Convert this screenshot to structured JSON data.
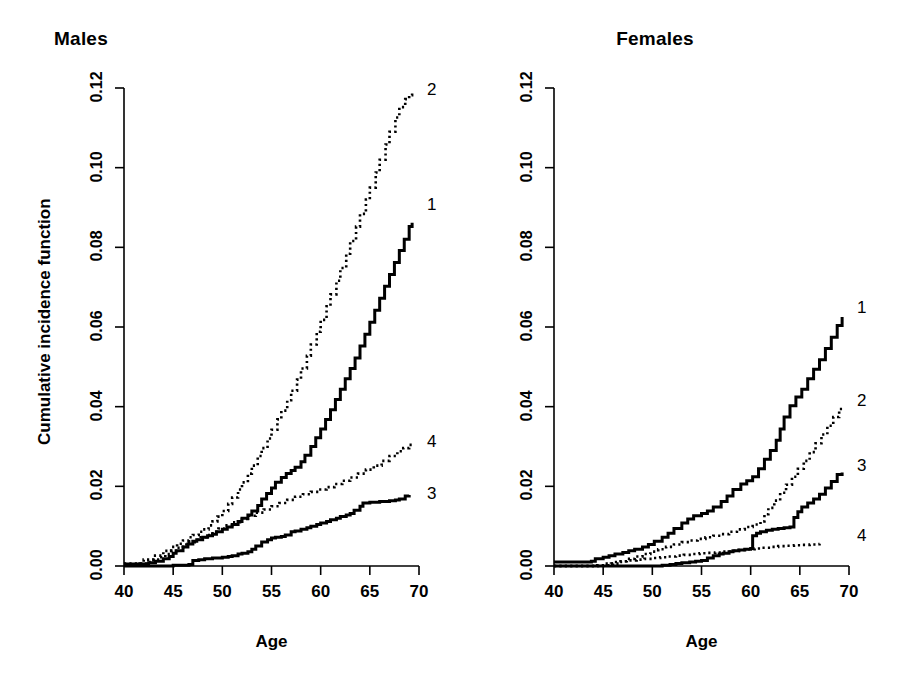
{
  "figure": {
    "background": "#ffffff",
    "ink": "#000000",
    "width": 912,
    "height": 693
  },
  "chart_data": {
    "type": "line",
    "title": "",
    "xlabel": "Age",
    "ylabel": "Cumulative incidence function",
    "xlim": [
      40,
      70
    ],
    "ylim": [
      0.0,
      0.12
    ],
    "xticks": [
      40,
      45,
      50,
      55,
      60,
      65,
      70
    ],
    "xtick_labels": [
      "40",
      "45",
      "50",
      "55",
      "60",
      "65",
      "70"
    ],
    "yticks": [
      0.0,
      0.02,
      0.04,
      0.06,
      0.08,
      0.1,
      0.12
    ],
    "ytick_labels": [
      "0.00",
      "0.02",
      "0.04",
      "0.06",
      "0.08",
      "0.10",
      "0.12"
    ],
    "grid": false,
    "legend_position": "right-of-curve-ends",
    "panels": [
      {
        "id": "males",
        "title": "Males",
        "series": [
          {
            "name": "1",
            "label": "1",
            "style": "solid",
            "stroke_width": 3,
            "label_x": 70.6,
            "label_y": 0.0905,
            "x": [
              40,
              42.5,
              43.2,
              44.0,
              44.6,
              45.0,
              45.3,
              46.0,
              46.5,
              47.0,
              47.4,
              48.0,
              48.5,
              49.0,
              49.4,
              50.0,
              50.5,
              51.0,
              51.6,
              52.0,
              52.6,
              53.0,
              53.6,
              54.0,
              54.5,
              55.0,
              55.4,
              56.0,
              56.5,
              57.0,
              57.4,
              58.0,
              58.4,
              59.0,
              59.5,
              60.0,
              60.5,
              61.0,
              61.5,
              62.0,
              62.5,
              63.0,
              63.5,
              64.0,
              64.5,
              65.0,
              65.5,
              66.0,
              66.5,
              67.0,
              67.5,
              68.0,
              68.5,
              69.0,
              69.3
            ],
            "y": [
              0.0005,
              0.0008,
              0.0012,
              0.0018,
              0.0024,
              0.0032,
              0.0038,
              0.0048,
              0.0055,
              0.0062,
              0.0066,
              0.0072,
              0.0076,
              0.008,
              0.0086,
              0.0092,
              0.0098,
              0.0104,
              0.0112,
              0.012,
              0.0128,
              0.0138,
              0.0152,
              0.0168,
              0.0182,
              0.0196,
              0.021,
              0.0222,
              0.0232,
              0.024,
              0.0248,
              0.0262,
              0.0278,
              0.03,
              0.0322,
              0.0344,
              0.0368,
              0.0392,
              0.0418,
              0.0444,
              0.047,
              0.0496,
              0.0522,
              0.0552,
              0.0582,
              0.0612,
              0.0642,
              0.0672,
              0.0702,
              0.0732,
              0.0762,
              0.0792,
              0.082,
              0.0852,
              0.0862
            ]
          },
          {
            "name": "2",
            "label": "2",
            "style": "dotted",
            "stroke_width": 2.6,
            "label_x": 70.6,
            "label_y": 0.1192,
            "x": [
              40,
              42.0,
              43.0,
              44.0,
              44.8,
              45.4,
              46.0,
              46.6,
              47.0,
              47.6,
              48.0,
              48.6,
              49.0,
              49.5,
              50.0,
              50.6,
              51.0,
              51.6,
              52.0,
              52.6,
              53.0,
              53.6,
              54.0,
              54.6,
              55.0,
              55.6,
              56.0,
              56.6,
              57.0,
              57.6,
              58.0,
              58.6,
              59.0,
              59.6,
              60.0,
              60.6,
              61.0,
              61.6,
              62.0,
              62.6,
              63.0,
              63.6,
              64.0,
              64.6,
              65.0,
              65.6,
              66.0,
              66.6,
              67.0,
              67.6,
              68.0,
              68.6,
              69.0,
              69.3
            ],
            "y": [
              0.0006,
              0.0016,
              0.0026,
              0.0038,
              0.0048,
              0.0056,
              0.0064,
              0.0072,
              0.0078,
              0.0086,
              0.0092,
              0.0102,
              0.0112,
              0.0124,
              0.0138,
              0.0156,
              0.0172,
              0.0192,
              0.021,
              0.0232,
              0.0252,
              0.0276,
              0.0296,
              0.032,
              0.0342,
              0.0368,
              0.039,
              0.0416,
              0.044,
              0.0468,
              0.0496,
              0.0528,
              0.0556,
              0.0588,
              0.0618,
              0.0652,
              0.0682,
              0.0716,
              0.0748,
              0.0784,
              0.0816,
              0.0852,
              0.0884,
              0.092,
              0.095,
              0.0988,
              0.102,
              0.1058,
              0.109,
              0.1126,
              0.1152,
              0.1172,
              0.1182,
              0.1186
            ]
          },
          {
            "name": "3",
            "label": "3",
            "style": "solid",
            "stroke_width": 3,
            "label_x": 70.6,
            "label_y": 0.0178,
            "x": [
              40,
              44.8,
              45.0,
              46.6,
              47.0,
              47.6,
              48.2,
              49.0,
              50.0,
              50.6,
              51.0,
              51.6,
              52.0,
              52.6,
              53.0,
              53.4,
              54.0,
              54.6,
              55.0,
              55.4,
              56.0,
              56.4,
              57.0,
              57.4,
              58.0,
              58.6,
              59.0,
              59.6,
              60.0,
              60.6,
              61.0,
              61.6,
              62.0,
              62.6,
              63.0,
              63.4,
              64.0,
              64.3,
              65.0,
              66.0,
              67.0,
              67.6,
              68.0,
              68.6,
              69.0
            ],
            "y": [
              0.0,
              0.0,
              0.0002,
              0.0004,
              0.0014,
              0.0016,
              0.0018,
              0.002,
              0.0022,
              0.0024,
              0.0026,
              0.003,
              0.0032,
              0.0036,
              0.0042,
              0.005,
              0.006,
              0.0066,
              0.007,
              0.0072,
              0.0074,
              0.0078,
              0.0086,
              0.0088,
              0.0092,
              0.0096,
              0.01,
              0.0104,
              0.0108,
              0.0112,
              0.0116,
              0.012,
              0.0124,
              0.0128,
              0.0132,
              0.014,
              0.015,
              0.0158,
              0.016,
              0.0162,
              0.0164,
              0.0166,
              0.0168,
              0.0176,
              0.0178
            ]
          },
          {
            "name": "4",
            "label": "4",
            "style": "dotted",
            "stroke_width": 2.6,
            "label_x": 70.6,
            "label_y": 0.0308,
            "x": [
              40,
              41.6,
              42.4,
              43.0,
              43.6,
              44.2,
              44.8,
              45.4,
              46.0,
              46.6,
              47.2,
              47.8,
              48.4,
              49.0,
              49.6,
              50.2,
              51.0,
              51.8,
              52.6,
              53.4,
              54.2,
              55.0,
              55.8,
              56.6,
              57.4,
              58.2,
              59.0,
              59.8,
              60.6,
              61.4,
              62.2,
              63.0,
              63.8,
              64.6,
              65.4,
              66.2,
              67.0,
              67.8,
              68.4,
              69.0,
              69.3
            ],
            "y": [
              0.0004,
              0.0006,
              0.001,
              0.0016,
              0.0022,
              0.003,
              0.0038,
              0.0046,
              0.0054,
              0.006,
              0.0066,
              0.0072,
              0.0078,
              0.0086,
              0.0094,
              0.0102,
              0.011,
              0.0118,
              0.0126,
              0.0134,
              0.0142,
              0.015,
              0.0158,
              0.0166,
              0.0174,
              0.018,
              0.0186,
              0.0192,
              0.0198,
              0.0206,
              0.0214,
              0.0222,
              0.0232,
              0.0242,
              0.0252,
              0.0264,
              0.0276,
              0.0288,
              0.0296,
              0.0304,
              0.0308
            ]
          }
        ]
      },
      {
        "id": "females",
        "title": "Females",
        "series": [
          {
            "name": "1",
            "label": "1",
            "style": "solid",
            "stroke_width": 3,
            "label_x": 70.6,
            "label_y": 0.0645,
            "x": [
              40,
              43.8,
              44.2,
              45.0,
              45.6,
              46.2,
              47.0,
              47.6,
              48.2,
              49.0,
              49.6,
              50.2,
              51.0,
              51.6,
              52.2,
              53.0,
              53.6,
              54.2,
              55.0,
              55.6,
              56.2,
              57.0,
              57.6,
              58.2,
              59.0,
              59.6,
              60.2,
              60.8,
              61.4,
              62.0,
              62.6,
              63.0,
              63.4,
              64.0,
              64.6,
              65.2,
              65.8,
              66.4,
              67.0,
              67.6,
              68.2,
              68.8,
              69.3
            ],
            "y": [
              0.001,
              0.0012,
              0.0018,
              0.0022,
              0.0026,
              0.003,
              0.0034,
              0.0038,
              0.0042,
              0.0048,
              0.0054,
              0.0062,
              0.0072,
              0.0082,
              0.0094,
              0.0108,
              0.0118,
              0.0126,
              0.0132,
              0.0138,
              0.0148,
              0.0162,
              0.0176,
              0.0192,
              0.0206,
              0.0214,
              0.0224,
              0.0244,
              0.0268,
              0.029,
              0.0316,
              0.0344,
              0.0374,
              0.0402,
              0.0424,
              0.0444,
              0.047,
              0.0494,
              0.0518,
              0.0546,
              0.0574,
              0.0604,
              0.0625
            ]
          },
          {
            "name": "2",
            "label": "2",
            "style": "dotted",
            "stroke_width": 2.6,
            "label_x": 70.6,
            "label_y": 0.0412,
            "x": [
              40,
              45.0,
              45.8,
              46.6,
              47.4,
              48.2,
              49.0,
              49.8,
              50.6,
              51.4,
              52.2,
              53.0,
              53.8,
              54.6,
              55.4,
              56.2,
              57.0,
              57.8,
              58.6,
              59.4,
              60.2,
              61.0,
              61.4,
              61.8,
              62.4,
              63.0,
              63.6,
              64.2,
              64.8,
              65.4,
              66.0,
              66.6,
              67.2,
              67.8,
              68.4,
              69.0,
              69.3
            ],
            "y": [
              0.0,
              0.0002,
              0.0006,
              0.0012,
              0.0018,
              0.0024,
              0.003,
              0.0036,
              0.0042,
              0.0048,
              0.0054,
              0.006,
              0.0064,
              0.0068,
              0.0072,
              0.0076,
              0.008,
              0.0086,
              0.0092,
              0.0098,
              0.0104,
              0.0112,
              0.013,
              0.0146,
              0.0164,
              0.0184,
              0.0204,
              0.0224,
              0.0244,
              0.0264,
              0.0286,
              0.0308,
              0.033,
              0.0352,
              0.0374,
              0.0394,
              0.04
            ]
          },
          {
            "name": "3",
            "label": "3",
            "style": "solid",
            "stroke_width": 3,
            "label_x": 70.6,
            "label_y": 0.0248,
            "x": [
              40,
              50.6,
              51.0,
              51.8,
              52.4,
              53.0,
              53.8,
              54.4,
              55.0,
              55.6,
              56.2,
              56.8,
              57.2,
              57.8,
              58.2,
              58.8,
              59.4,
              60.0,
              60.2,
              60.6,
              61.0,
              61.6,
              62.2,
              62.8,
              63.4,
              64.0,
              64.4,
              64.8,
              65.2,
              65.8,
              66.4,
              67.0,
              67.6,
              68.2,
              68.8,
              69.3
            ],
            "y": [
              0.0,
              0.0,
              0.0002,
              0.0004,
              0.0006,
              0.0008,
              0.001,
              0.0012,
              0.0014,
              0.002,
              0.0026,
              0.003,
              0.0032,
              0.0036,
              0.0038,
              0.004,
              0.0042,
              0.0044,
              0.0076,
              0.0082,
              0.0086,
              0.009,
              0.0092,
              0.0094,
              0.0096,
              0.0098,
              0.0122,
              0.0136,
              0.0148,
              0.0158,
              0.0168,
              0.018,
              0.0196,
              0.0212,
              0.023,
              0.0235
            ]
          },
          {
            "name": "4",
            "label": "4",
            "style": "dotted",
            "stroke_width": 2.6,
            "label_x": 70.6,
            "label_y": 0.0072,
            "x": [
              40,
              44.4,
              45.2,
              46.0,
              46.8,
              47.6,
              48.4,
              49.2,
              50.0,
              50.8,
              51.6,
              52.4,
              53.2,
              54.0,
              54.8,
              55.6,
              56.4,
              57.2,
              58.0,
              58.8,
              59.6,
              60.4,
              61.2,
              62.0,
              62.8,
              63.6,
              64.4,
              65.2,
              66.0,
              66.6,
              67.0
            ],
            "y": [
              0.0,
              0.0002,
              0.0006,
              0.001,
              0.0012,
              0.0014,
              0.0016,
              0.0018,
              0.002,
              0.0022,
              0.0024,
              0.0026,
              0.0028,
              0.003,
              0.0032,
              0.0033,
              0.0034,
              0.0036,
              0.0038,
              0.004,
              0.0042,
              0.0044,
              0.0046,
              0.0048,
              0.005,
              0.0051,
              0.0052,
              0.0053,
              0.0054,
              0.0055,
              0.0056
            ]
          }
        ]
      }
    ]
  }
}
